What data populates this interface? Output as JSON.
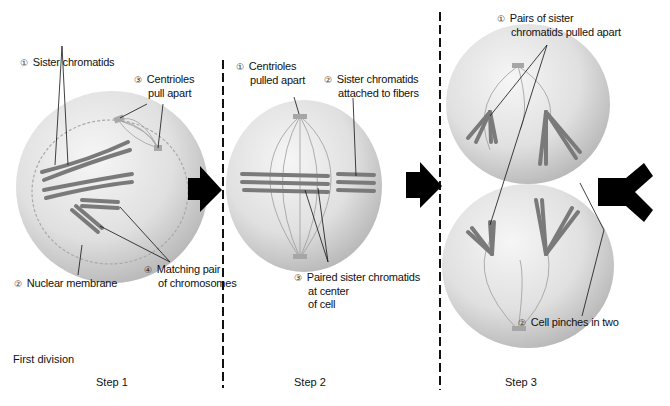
{
  "figure": {
    "section_label": "First division",
    "steps": [
      {
        "label": "Step 1",
        "annotations": [
          {
            "num": "①",
            "lines": [
              "Sister chromatids"
            ]
          },
          {
            "num": "③",
            "lines": [
              "Centrioles",
              "pull apart"
            ]
          },
          {
            "num": "②",
            "lines": [
              "Nuclear membrane"
            ]
          },
          {
            "num": "④",
            "lines": [
              "Matching pair",
              "of chromosomes"
            ]
          }
        ]
      },
      {
        "label": "Step 2",
        "annotations": [
          {
            "num": "①",
            "lines": [
              "Centrioles",
              "pulled apart"
            ]
          },
          {
            "num": "②",
            "lines": [
              "Sister chromatids",
              "attached to fibers"
            ]
          },
          {
            "num": "③",
            "lines": [
              "Paired sister chromatids",
              "at center",
              "of cell"
            ]
          }
        ]
      },
      {
        "label": "Step 3",
        "annotations": [
          {
            "num": "①",
            "lines": [
              "Pairs of sister",
              "chromatids pulled apart"
            ]
          },
          {
            "num": "②",
            "lines": [
              "Cell pinches in two"
            ]
          }
        ]
      }
    ],
    "colors": {
      "cell": "#e2e2e2",
      "cell_shade": "#b8b8b8",
      "chromosome": "#7a7a7a",
      "arrow": "#000000",
      "divider": "#111111"
    }
  }
}
